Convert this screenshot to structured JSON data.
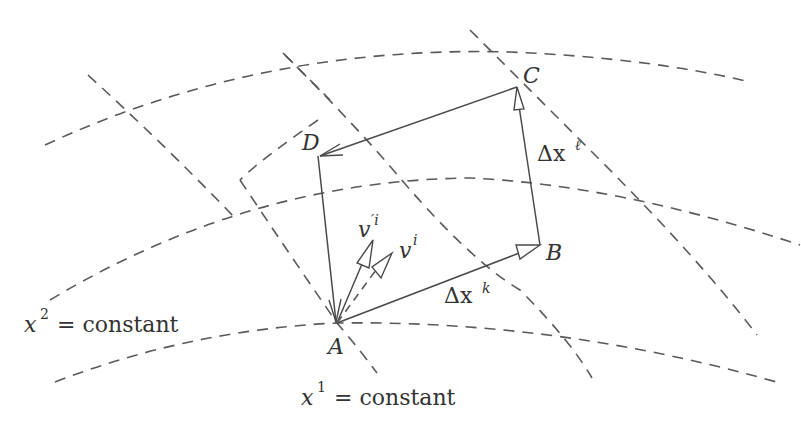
{
  "diagram": {
    "type": "vector parallel transport around a closed loop in curvilinear coordinates",
    "points": {
      "A": {
        "label": "A"
      },
      "B": {
        "label": "B"
      },
      "C": {
        "label": "C"
      },
      "D": {
        "label": "D"
      }
    },
    "edges": {
      "AB": {
        "label_base": "Δx",
        "label_sup": "k"
      },
      "BC": {
        "label_base": "Δx",
        "label_sup": "ℓ"
      },
      "CD": {
        "label_base": "",
        "label_sup": ""
      },
      "DA": {
        "label_base": "",
        "label_sup": ""
      }
    },
    "vectors": {
      "v": {
        "label_base": "v",
        "label_sup": "i"
      },
      "v_prime": {
        "label_base": "v",
        "label_sup": "′i"
      }
    },
    "coordinate_labels": {
      "x2": {
        "base": "x",
        "sup": "2",
        "rest": " = constant"
      },
      "x1": {
        "base": "x",
        "sup": "1",
        "rest": " = constant"
      }
    },
    "colors": {
      "lines": "#4a4a4a",
      "dashes": "#5a5a5a",
      "text": "#333333",
      "background": "#ffffff"
    }
  }
}
